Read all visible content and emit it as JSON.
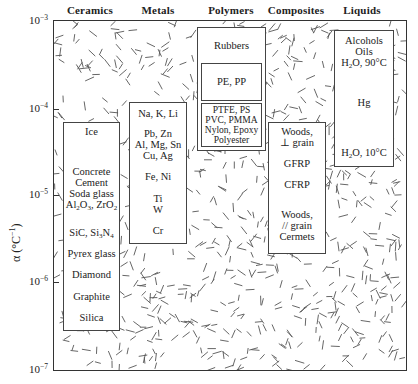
{
  "chart_data": {
    "type": "range-bar",
    "title": "",
    "xlabel": "",
    "ylabel": "α (°C⁻¹)",
    "yscale": "log",
    "ylim": [
      1e-07,
      0.001
    ],
    "yticks": [
      "10⁻³",
      "10⁻⁴",
      "10⁻⁵",
      "10⁻⁶",
      "10⁻⁷"
    ],
    "categories": [
      "Ceramics",
      "Metals",
      "Polymers",
      "Composites",
      "Liquids"
    ],
    "ranges": [
      {
        "category": "Ceramics",
        "min": 4e-07,
        "max": 5e-05,
        "materials": [
          "Ice",
          "Concrete",
          "Cement",
          "Soda glass",
          "Al2O3, ZrO2",
          "SiC, Si3N4",
          "Pyrex glass",
          "Diamond",
          "Graphite",
          "Silica"
        ]
      },
      {
        "category": "Metals",
        "min": 3e-06,
        "max": 8e-05,
        "materials": [
          "Na, K, Li",
          "Pb, Zn",
          "Al, Mg, Sn",
          "Cu, Ag",
          "Fe, Ni",
          "Ti",
          "W",
          "Cr"
        ]
      },
      {
        "category": "Polymers",
        "min": 3.5e-05,
        "max": 0.0008,
        "materials": [
          "Rubbers",
          "PE, PP",
          "PTFE, PS",
          "PVC, PMMA",
          "Nylon, Epoxy",
          "Polyester"
        ]
      },
      {
        "category": "Composites",
        "min": 2.5e-06,
        "max": 5e-05,
        "materials": [
          "Woods, ⊥ grain",
          "GFRP",
          "CFRP",
          "Woods, // grain",
          "Cermets"
        ]
      },
      {
        "category": "Liquids",
        "min": 2.3e-05,
        "max": 0.0009,
        "materials": [
          "Alcohols",
          "Oils",
          "H2O, 90°C",
          "Hg",
          "H2O, 10°C"
        ]
      }
    ],
    "grid": false,
    "legend": "none"
  },
  "header": {
    "categories": [
      "Ceramics",
      "Metals",
      "Polymers",
      "Composites",
      "Liquids"
    ]
  },
  "axis": {
    "title_prefix": "α (°C",
    "title_sup": "−1",
    "title_suffix": ")",
    "ticks": [
      {
        "base": "10",
        "exp": "−3"
      },
      {
        "base": "10",
        "exp": "−4"
      },
      {
        "base": "10",
        "exp": "−5"
      },
      {
        "base": "10",
        "exp": "−6"
      },
      {
        "base": "10",
        "exp": "−7"
      }
    ]
  },
  "ceramics": {
    "ice": "Ice",
    "concrete": "Concrete",
    "cement": "Cement",
    "soda_glass": "Soda glass",
    "al": "Al",
    "al_sub2": "2",
    "o": "O",
    "o_sub3": "3",
    "zro": ", ZrO",
    "zro_sub": "2",
    "sic": "SiC, Si",
    "si_sub": "3",
    "n": "N",
    "n_sub": "4",
    "pyrex": "Pyrex glass",
    "diamond": "Diamond",
    "graphite": "Graphite",
    "silica": "Silica"
  },
  "metals": {
    "alkali": "Na, K, Li",
    "pb": "Pb, Zn",
    "al": "Al, Mg, Sn",
    "cu": "Cu, Ag",
    "fe": "Fe, Ni",
    "ti": "Ti",
    "w": "W",
    "cr": "Cr"
  },
  "polymers": {
    "rubbers": "Rubbers",
    "pe": "PE, PP",
    "ptfe": "PTFE, PS",
    "pvc": "PVC, PMMA",
    "nylon": "Nylon, Epoxy",
    "polyester": "Polyester"
  },
  "composites": {
    "woods_perp": "Woods,",
    "perp_grain": "⊥ grain",
    "gfrp": "GFRP",
    "cfrp": "CFRP",
    "woods_par": "Woods,",
    "par_grain": "// grain",
    "cermets": "Cermets"
  },
  "liquids": {
    "alcohols": "Alcohols",
    "oils": "Oils",
    "h": "H",
    "h_sub": "2",
    "o90": "O, 90°C",
    "hg": "Hg",
    "h10": "H",
    "h10_sub": "2",
    "o10": "O, 10°C"
  }
}
